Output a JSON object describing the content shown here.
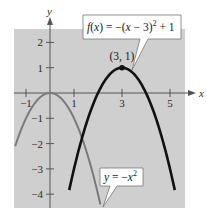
{
  "chart_data": {
    "type": "line",
    "title": "",
    "xlabel": "x",
    "ylabel": "y",
    "xlim": [
      -1.5,
      5.6
    ],
    "ylim": [
      -4.6,
      2.6
    ],
    "grid": false,
    "background": "#cfcfcf",
    "x_ticks": [
      -1,
      1,
      3,
      5
    ],
    "x_tick_labels": [
      "-1",
      "1",
      "3",
      "5"
    ],
    "x_minor_ticks": [
      -1,
      1,
      3,
      5
    ],
    "y_ticks": [
      2,
      1,
      -1,
      -2,
      -3,
      -4
    ],
    "y_tick_labels": [
      "2",
      "1",
      "-1",
      "-2",
      "-3",
      "-4"
    ],
    "series": [
      {
        "name": "f(x) = -(x - 3)^2 + 1",
        "equation": "-(x-3)^2+1",
        "color": "#111111",
        "stroke_width": 2.6,
        "x_range": [
          0.8,
          5.2
        ],
        "x": [
          0.8,
          1,
          1.5,
          2,
          2.5,
          3,
          3.5,
          4,
          4.5,
          5,
          5.2
        ],
        "y": [
          -3.84,
          -3,
          -1.25,
          0,
          0.75,
          1,
          0.75,
          0,
          -1.25,
          -3,
          -3.84
        ]
      },
      {
        "name": "y = -x^2",
        "equation": "-x^2",
        "color": "#7a7a7a",
        "stroke_width": 2,
        "x_range": [
          -1.45,
          2.1
        ],
        "x": [
          -1.45,
          -1,
          -0.5,
          0,
          0.5,
          1,
          1.5,
          2,
          2.1
        ],
        "y": [
          -2.1,
          -1,
          -0.25,
          0,
          -0.25,
          -1,
          -2.25,
          -4,
          -4.41
        ]
      }
    ],
    "annotations": [
      {
        "type": "point",
        "x": 3,
        "y": 1,
        "label": "(3, 1)"
      },
      {
        "type": "callout",
        "text": "f(x) = -(x - 3)^2 + 1",
        "target_series": 0
      },
      {
        "type": "callout",
        "text": "y = -x^2",
        "target_series": 1
      }
    ]
  },
  "labels": {
    "x_axis": "x",
    "y_axis": "y",
    "vertex": "(3, 1)",
    "callout_f": {
      "fx": "f",
      "open": "(",
      "x": "x",
      "close": ")",
      "eq": " = −(",
      "x2": "x",
      "rest": " − 3)",
      "exp": "2",
      "tail": " + 1"
    },
    "callout_g": {
      "y": "y",
      "eq": " = −",
      "x": "x",
      "exp": "2"
    }
  }
}
